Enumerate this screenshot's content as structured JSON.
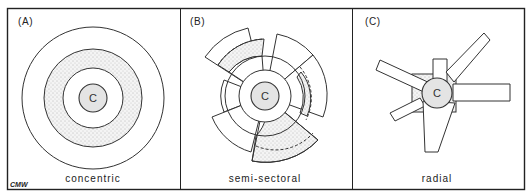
{
  "figure": {
    "panels": [
      {
        "id": "A",
        "label": "(A)",
        "caption": "concentric",
        "center_label": "C"
      },
      {
        "id": "B",
        "label": "(B)",
        "caption": "semi-sectoral",
        "center_label": "C"
      },
      {
        "id": "C",
        "label": "(C)",
        "caption": "radial",
        "center_label": "C"
      }
    ],
    "signature": "CMW",
    "colors": {
      "line": "#333333",
      "core_fill": "#e4e4e4",
      "background": "#ffffff"
    }
  }
}
